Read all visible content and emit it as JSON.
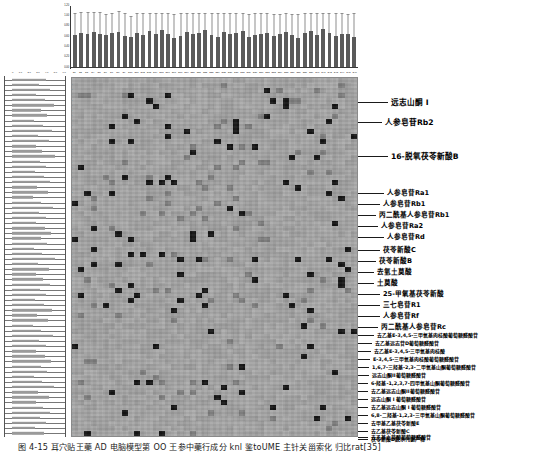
{
  "figure": {
    "caption": "图 4-15    耳穴贴王藥 AD 电脑模型第 OO 王参中藥行成分 knl 鉴toUME 主针关甾索化 归比rat[35]"
  },
  "top_chart": {
    "name": "compound-abundance-bar-chart",
    "y_ticks": [
      "1.20",
      "1.00",
      "0.80",
      "0.60",
      "0.40",
      "0.20",
      "0.00"
    ],
    "ylim": [
      0,
      1.2
    ],
    "bar_color": "#5a5a5a",
    "error_color": "#8e8e8e"
  },
  "left_chart": {
    "name": "sample-intensity-bar-chart",
    "x_ticks": [
      "0",
      "1.0",
      "2.0",
      "3.0",
      "4.0",
      "5.0",
      "6.0"
    ],
    "bar_color": "#9a9a9a"
  },
  "heatmap": {
    "name": "compound-sample-heatmap",
    "background": "#ababab",
    "dark_cell": "#141414",
    "mid_cell": "#7d7d7d"
  },
  "annotations": [
    {
      "label": "远志山酮 I",
      "size": "sz-lg"
    },
    {
      "label": "人参皂苷Rb2",
      "size": "sz-lg"
    },
    {
      "label": "16-脱氧茯苓新酸B",
      "size": "sz-lg"
    },
    {
      "label": "人参皂苷Ra1",
      "size": "sz-md"
    },
    {
      "label": "人参皂苷Rb1",
      "size": "sz-md"
    },
    {
      "label": "丙二酰基人参皂苷Rb1",
      "size": "sz-md"
    },
    {
      "label": "人参皂苷Ra2",
      "size": "sz-md"
    },
    {
      "label": "人参皂苷Rd",
      "size": "sz-md"
    },
    {
      "label": "茯苓新酸C",
      "size": "sz-md"
    },
    {
      "label": "茯苓新酸B",
      "size": "sz-md"
    },
    {
      "label": "去氢土莫酸",
      "size": "sz-md"
    },
    {
      "label": "土莫酸",
      "size": "sz-md"
    },
    {
      "label": "25-甲氧基茯苓新酸",
      "size": "sz-md"
    },
    {
      "label": "三七皂苷R1",
      "size": "sz-md"
    },
    {
      "label": "人参皂苷Rf",
      "size": "sz-md"
    },
    {
      "label": "丙二酰基人参皂苷Rc",
      "size": "sz-md"
    },
    {
      "label": "去乙基E-3,4,5-三甲氧基肉桂酸葡萄糖醛酸苷",
      "size": "sz-xs"
    },
    {
      "label": "去乙基远志苷D葡萄糖醛酸苷",
      "size": "sz-xs"
    },
    {
      "label": "去乙基E-3,4,5-三甲氧基肉桂酸",
      "size": "sz-xs"
    },
    {
      "label": "E-3,4,5-三甲氧基肉桂酸葡萄糖醛酸苷",
      "size": "sz-xs"
    },
    {
      "label": "1,6,7-三羟基-2,3-二甲氧基山酮葡萄糖醛酸苷",
      "size": "sz-xs"
    },
    {
      "label": "远志山酮II葡萄糖醛酸苷",
      "size": "sz-xs"
    },
    {
      "label": "6-羟基-1,2,3,7-四甲氧基山酮葡萄糖醛酸苷",
      "size": "sz-xs"
    },
    {
      "label": "去乙基远志山酮II葡萄糖醛酸苷",
      "size": "sz-xs"
    },
    {
      "label": "远志山酮 I 葡萄糖醛酸苷",
      "size": "sz-xs"
    },
    {
      "label": "去乙基远志山酮 I 葡萄糖醛酸苷",
      "size": "sz-xs"
    },
    {
      "label": "6,8-二羟基-1,2,3-三甲氧基山酮葡萄糖醛酸苷",
      "size": "sz-xs"
    },
    {
      "label": "去甲基乙基茯苓新酸E",
      "size": "sz-xs"
    },
    {
      "label": "去乙基茯苓新酸C",
      "size": "sz-xs"
    },
    {
      "label": "去乙基土莫酸葡萄糖醛酸苷",
      "size": "sz-xs"
    },
    {
      "label": "茯苓新酸D脱水代谢产物",
      "size": "sz-xs"
    }
  ],
  "chart_data": {
    "type": "heatmap",
    "title": "",
    "xlabel": "",
    "ylabel": "",
    "grid": true,
    "legend": "none",
    "top_bar": {
      "type": "bar",
      "ylabel": "Relative abundance",
      "ylim": [
        0,
        1.2
      ],
      "yticks": [
        0,
        0.2,
        0.4,
        0.6,
        0.8,
        1.0,
        1.2
      ],
      "categories": [
        "S1",
        "S2",
        "S3",
        "S4",
        "S5",
        "S6",
        "S7",
        "S8",
        "S9",
        "S10",
        "S11",
        "S12",
        "S13",
        "S14",
        "S15",
        "S16",
        "S17",
        "S18",
        "S19",
        "S20",
        "S21",
        "S22",
        "S23",
        "S24",
        "S25",
        "S26",
        "S27",
        "S28",
        "S29",
        "S30",
        "S31",
        "S32",
        "S33",
        "S34",
        "S35",
        "S36",
        "S37",
        "S38",
        "S39",
        "S40",
        "S41",
        "S42",
        "S43",
        "S44",
        "S45",
        "S46"
      ],
      "values": [
        0.62,
        0.66,
        0.63,
        0.68,
        0.64,
        0.61,
        0.65,
        0.67,
        0.6,
        0.58,
        0.66,
        0.62,
        0.69,
        0.64,
        0.71,
        0.63,
        0.56,
        0.6,
        0.68,
        0.64,
        0.66,
        0.72,
        0.61,
        0.59,
        0.67,
        0.63,
        0.65,
        0.7,
        0.58,
        0.62,
        0.64,
        0.66,
        0.6,
        0.63,
        0.68,
        0.61,
        0.57,
        0.65,
        0.69,
        0.62,
        0.74,
        0.66,
        0.6,
        0.64,
        0.63,
        0.59
      ],
      "errors": [
        0.42,
        0.4,
        0.44,
        0.38,
        0.43,
        0.41,
        0.39,
        0.42,
        0.45,
        0.4,
        0.38,
        0.43,
        0.36,
        0.41,
        0.34,
        0.42,
        0.46,
        0.44,
        0.37,
        0.4,
        0.39,
        0.33,
        0.43,
        0.45,
        0.38,
        0.41,
        0.4,
        0.35,
        0.44,
        0.42,
        0.41,
        0.39,
        0.43,
        0.4,
        0.37,
        0.42,
        0.46,
        0.39,
        0.36,
        0.42,
        0.31,
        0.38,
        0.44,
        0.41,
        0.4,
        0.45
      ]
    },
    "left_bar": {
      "type": "bar",
      "orientation": "horizontal",
      "xlim": [
        0,
        6.0
      ],
      "xticks": [
        0,
        1.0,
        2.0,
        3.0,
        4.0,
        5.0,
        6.0
      ],
      "values": [
        4.1,
        3.2,
        4.6,
        2.8,
        3.9,
        5.0,
        3.4,
        4.2,
        2.6,
        3.7,
        4.8,
        3.1,
        4.4,
        2.9,
        3.6,
        5.2,
        3.3,
        4.0,
        2.7,
        3.8,
        4.5,
        3.0,
        4.3,
        2.5,
        3.5,
        4.9,
        3.2,
        4.1,
        2.8,
        3.9,
        4.7,
        3.4,
        4.2,
        2.6,
        3.6,
        5.1,
        3.1,
        4.4,
        2.9,
        3.7,
        4.6,
        3.3,
        4.0,
        2.7,
        3.8,
        4.8,
        3.0,
        4.3,
        2.5,
        3.5,
        4.9,
        3.2,
        4.1,
        2.8,
        3.9,
        4.7,
        3.4,
        4.2,
        2.6,
        3.6,
        5.0,
        3.1,
        4.4,
        2.9,
        3.7,
        4.5,
        3.3,
        4.0,
        2.7,
        3.8
      ]
    }
  }
}
